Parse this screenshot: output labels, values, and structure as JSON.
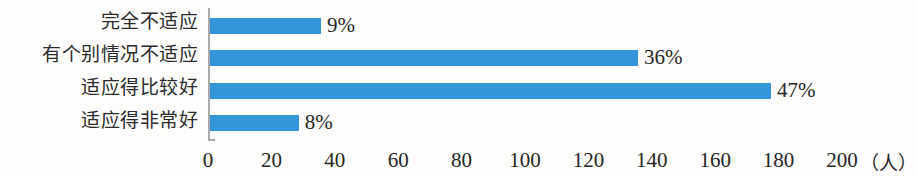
{
  "chart_data": {
    "type": "bar",
    "orientation": "horizontal",
    "title": "",
    "subtitle": "",
    "xlabel": "（人）",
    "ylabel": "",
    "categories": [
      "完全不适应",
      "有个别情况不适应",
      "适应得比较好",
      "适应得非常好"
    ],
    "values": [
      35,
      135,
      177,
      28
    ],
    "data_labels": [
      "9%",
      "36%",
      "47%",
      "8%"
    ],
    "xlim": [
      0,
      200
    ],
    "xticks": [
      0,
      20,
      40,
      60,
      80,
      100,
      120,
      140,
      160,
      180,
      200
    ],
    "xtick_labels": [
      "0",
      "20",
      "40",
      "60",
      "80",
      "100",
      "120",
      "140",
      "160",
      "180",
      "200"
    ],
    "unit_annotation": "（人）",
    "grid": false,
    "legend": false,
    "bar_color": "#3195d8",
    "axis_color": "#a9a9a9",
    "text_color": "#262626",
    "background_color": "#fdfdfc"
  }
}
